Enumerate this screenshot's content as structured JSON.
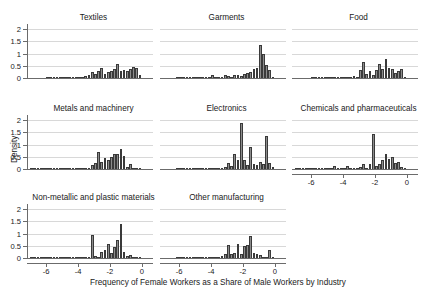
{
  "chart_data": {
    "type": "bar",
    "title": "",
    "xlabel": "Frequency of Female Workers as a Share of Male Workers by Industry",
    "ylabel": "Density",
    "xlim": [
      -7.2,
      0.7
    ],
    "ylim": [
      0,
      2.25
    ],
    "xticks": [
      -6,
      -4,
      -2,
      0
    ],
    "xtick_labels": [
      "-6",
      "-4",
      "-2",
      "0"
    ],
    "yticks": [
      0,
      0.5,
      1,
      1.5,
      2
    ],
    "ytick_labels": [
      "0",
      "0.5",
      "1",
      "1.5",
      "2"
    ],
    "grid": "horizontal",
    "legend": "none",
    "layout": "3x3 small-multiples, 8 panels",
    "bin_width": 0.2,
    "bar_fill": "#8c8c8c",
    "bar_edge": "#3a3a3a",
    "grid_color": "#d8d8d8",
    "axis_color": "#6b6b6b",
    "panels": [
      {
        "name": "Textiles",
        "row": 0,
        "col": 0,
        "bin_centers": [
          -6.9,
          -6.7,
          -6.5,
          -6.3,
          -6.1,
          -5.9,
          -5.7,
          -5.5,
          -5.3,
          -5.1,
          -4.9,
          -4.7,
          -4.5,
          -4.3,
          -4.1,
          -3.9,
          -3.7,
          -3.5,
          -3.3,
          -3.1,
          -2.9,
          -2.7,
          -2.5,
          -2.3,
          -2.1,
          -1.9,
          -1.7,
          -1.5,
          -1.3,
          -1.1,
          -0.9,
          -0.7,
          -0.5,
          -0.3,
          -0.1
        ],
        "values": [
          0,
          0,
          0,
          0,
          0,
          0.01,
          0.01,
          0.02,
          0.03,
          0.03,
          0.02,
          0.04,
          0.05,
          0.04,
          0.06,
          0.09,
          0.1,
          0.13,
          0.17,
          0.28,
          0.2,
          0.33,
          0.46,
          0.22,
          0.3,
          0.32,
          0.41,
          0.61,
          0.33,
          0.37,
          0.33,
          0.41,
          0.48,
          0.46,
          0.15
        ]
      },
      {
        "name": "Garments",
        "row": 0,
        "col": 1,
        "bin_centers": [
          -6.9,
          -6.7,
          -6.5,
          -6.3,
          -6.1,
          -5.9,
          -5.7,
          -5.5,
          -5.3,
          -5.1,
          -4.9,
          -4.7,
          -4.5,
          -4.3,
          -4.1,
          -3.9,
          -3.7,
          -3.5,
          -3.3,
          -3.1,
          -2.9,
          -2.7,
          -2.5,
          -2.3,
          -2.1,
          -1.9,
          -1.7,
          -1.5,
          -1.3,
          -1.1,
          -0.9,
          -0.7,
          -0.5,
          -0.3,
          -0.1
        ],
        "values": [
          0,
          0,
          0,
          0,
          0.01,
          0.01,
          0.01,
          0.02,
          0.02,
          0.02,
          0.03,
          0.04,
          0.03,
          0.05,
          0.06,
          0.16,
          0.08,
          0.04,
          0.05,
          0.18,
          0.14,
          0.1,
          0.17,
          0.18,
          0.12,
          0.22,
          0.26,
          0.3,
          0.42,
          0.47,
          1.4,
          1.01,
          0.56,
          0.36,
          0.05
        ]
      },
      {
        "name": "Food",
        "row": 0,
        "col": 2,
        "bin_centers": [
          -6.9,
          -6.7,
          -6.5,
          -6.3,
          -6.1,
          -5.9,
          -5.7,
          -5.5,
          -5.3,
          -5.1,
          -4.9,
          -4.7,
          -4.5,
          -4.3,
          -4.1,
          -3.9,
          -3.7,
          -3.5,
          -3.3,
          -3.1,
          -2.9,
          -2.7,
          -2.5,
          -2.3,
          -2.1,
          -1.9,
          -1.7,
          -1.5,
          -1.3,
          -1.1,
          -0.9,
          -0.7,
          -0.5,
          -0.3,
          -0.1
        ],
        "values": [
          0,
          0,
          0,
          0,
          0,
          0.01,
          0.01,
          0.01,
          0.02,
          0.02,
          0.02,
          0.03,
          0.04,
          0.03,
          0.05,
          0.07,
          0.05,
          0.09,
          0.12,
          0.08,
          0.37,
          0.68,
          0.22,
          0.31,
          0.16,
          0.35,
          0.6,
          0.39,
          0.82,
          0.45,
          0.4,
          0.25,
          0.33,
          0.41,
          0.09
        ]
      },
      {
        "name": "Metals and machinery",
        "row": 1,
        "col": 0,
        "bin_centers": [
          -6.9,
          -6.7,
          -6.5,
          -6.3,
          -6.1,
          -5.9,
          -5.7,
          -5.5,
          -5.3,
          -5.1,
          -4.9,
          -4.7,
          -4.5,
          -4.3,
          -4.1,
          -3.9,
          -3.7,
          -3.5,
          -3.3,
          -3.1,
          -2.9,
          -2.7,
          -2.5,
          -2.3,
          -2.1,
          -1.9,
          -1.7,
          -1.5,
          -1.3,
          -1.1,
          -0.9,
          -0.7,
          -0.5,
          -0.3,
          -0.1
        ],
        "values": [
          0.01,
          0.01,
          0.01,
          0.01,
          0.01,
          0.02,
          0.02,
          0.03,
          0.08,
          0.04,
          0.03,
          0.02,
          0.03,
          0.09,
          0.05,
          0.04,
          0.05,
          0.06,
          0.1,
          0.21,
          0.3,
          0.74,
          0.33,
          0.49,
          0.43,
          0.53,
          0.64,
          0.65,
          0.85,
          0.58,
          0.14,
          0.26,
          0.07,
          0.04,
          0.01
        ]
      },
      {
        "name": "Electronics",
        "row": 1,
        "col": 1,
        "bin_centers": [
          -6.9,
          -6.7,
          -6.5,
          -6.3,
          -6.1,
          -5.9,
          -5.7,
          -5.5,
          -5.3,
          -5.1,
          -4.9,
          -4.7,
          -4.5,
          -4.3,
          -4.1,
          -3.9,
          -3.7,
          -3.5,
          -3.3,
          -3.1,
          -2.9,
          -2.7,
          -2.5,
          -2.3,
          -2.1,
          -1.9,
          -1.7,
          -1.5,
          -1.3,
          -1.1,
          -0.9,
          -0.7,
          -0.5,
          -0.3,
          -0.1
        ],
        "values": [
          0,
          0,
          0,
          0,
          0.01,
          0.01,
          0.01,
          0.01,
          0.02,
          0.02,
          0.02,
          0.03,
          0.03,
          0.04,
          0.04,
          0.05,
          0.06,
          0.07,
          0.08,
          0.12,
          0.3,
          0.18,
          0.64,
          0.42,
          1.92,
          0.41,
          0.2,
          0.96,
          0.24,
          0.19,
          0.32,
          0.25,
          1.38,
          0.3,
          0.11
        ]
      },
      {
        "name": "Chemicals and pharmaceuticals",
        "row": 1,
        "col": 2,
        "bin_centers": [
          -6.9,
          -6.7,
          -6.5,
          -6.3,
          -6.1,
          -5.9,
          -5.7,
          -5.5,
          -5.3,
          -5.1,
          -4.9,
          -4.7,
          -4.5,
          -4.3,
          -4.1,
          -3.9,
          -3.7,
          -3.5,
          -3.3,
          -3.1,
          -2.9,
          -2.7,
          -2.5,
          -2.3,
          -2.1,
          -1.9,
          -1.7,
          -1.5,
          -1.3,
          -1.1,
          -0.9,
          -0.7,
          -0.5,
          -0.3,
          -0.1
        ],
        "values": [
          0.01,
          0.01,
          0.01,
          0.01,
          0.02,
          0.02,
          0.02,
          0.03,
          0.02,
          0.03,
          0.04,
          0.03,
          0.16,
          0.05,
          0.04,
          0.06,
          0.15,
          0.06,
          0.05,
          0.07,
          0.12,
          0.26,
          0.09,
          0.24,
          1.49,
          0.16,
          0.24,
          0.4,
          0.67,
          0.45,
          0.54,
          0.3,
          0.34,
          0.13,
          0.05
        ]
      },
      {
        "name": "Non-metallic and plastic materials",
        "row": 2,
        "col": 0,
        "bin_centers": [
          -6.9,
          -6.7,
          -6.5,
          -6.3,
          -6.1,
          -5.9,
          -5.7,
          -5.5,
          -5.3,
          -5.1,
          -4.9,
          -4.7,
          -4.5,
          -4.3,
          -4.1,
          -3.9,
          -3.7,
          -3.5,
          -3.3,
          -3.1,
          -2.9,
          -2.7,
          -2.5,
          -2.3,
          -2.1,
          -1.9,
          -1.7,
          -1.5,
          -1.3,
          -1.1,
          -0.9,
          -0.7,
          -0.5,
          -0.3,
          -0.1
        ],
        "values": [
          0.01,
          0.01,
          0.01,
          0.01,
          0.01,
          0.02,
          0.02,
          0.02,
          0.03,
          0.06,
          0.03,
          0.04,
          0.05,
          0.09,
          0.04,
          0.05,
          0.08,
          0.1,
          0.07,
          1.0,
          0.12,
          0.08,
          0.27,
          0.36,
          0.6,
          0.23,
          0.48,
          0.78,
          1.42,
          0.3,
          0.13,
          0.16,
          0.08,
          0.06,
          0.05
        ]
      },
      {
        "name": "Other manufacturing",
        "row": 2,
        "col": 1,
        "bin_centers": [
          -6.9,
          -6.7,
          -6.5,
          -6.3,
          -6.1,
          -5.9,
          -5.7,
          -5.5,
          -5.3,
          -5.1,
          -4.9,
          -4.7,
          -4.5,
          -4.3,
          -4.1,
          -3.9,
          -3.7,
          -3.5,
          -3.3,
          -3.1,
          -2.9,
          -2.7,
          -2.5,
          -2.3,
          -2.1,
          -1.9,
          -1.7,
          -1.5,
          -1.3,
          -1.1,
          -0.9,
          -0.7,
          -0.5,
          -0.3,
          -0.1
        ],
        "values": [
          0,
          0,
          0,
          0,
          0.01,
          0.01,
          0.01,
          0.01,
          0.02,
          0.02,
          0.03,
          0.03,
          0.06,
          0.05,
          0.04,
          0.06,
          0.08,
          0.07,
          0.13,
          0.19,
          0.58,
          0.22,
          0.26,
          0.62,
          0.21,
          0.53,
          0.56,
          0.95,
          0.24,
          0.2,
          0.16,
          0.09,
          0.1,
          0.38,
          0.04
        ]
      }
    ]
  }
}
